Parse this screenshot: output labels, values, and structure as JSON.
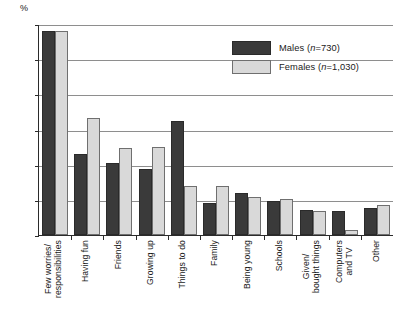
{
  "chart_data": {
    "type": "bar",
    "title": "",
    "xlabel": "",
    "ylabel": "%",
    "ylim": [
      0,
      30
    ],
    "yticks": [
      0,
      5,
      10,
      15,
      20,
      25,
      30
    ],
    "grid": true,
    "legend_position": "top-right",
    "categories": [
      "Few worries/\nresponsibilities",
      "Having fun",
      "Friends",
      "Growing up",
      "Things to do",
      "Family",
      "Being young",
      "Schools",
      "Given/\nbought things",
      "Computers\nand TV",
      "Other"
    ],
    "series": [
      {
        "name": "Males (n=730)",
        "key": "males",
        "color": "#3a3a3a",
        "values": [
          29.0,
          11.5,
          10.2,
          9.4,
          16.2,
          4.6,
          6.0,
          4.9,
          3.5,
          3.4,
          3.9
        ]
      },
      {
        "name": "Females (n=1,030)",
        "key": "females",
        "color": "#d9d9d9",
        "values": [
          29.0,
          16.6,
          12.4,
          12.5,
          7.0,
          7.0,
          5.4,
          5.1,
          3.4,
          0.7,
          4.2
        ]
      }
    ]
  },
  "axis": {
    "y_label": "%",
    "ticks": [
      "30",
      "25",
      "20",
      "15",
      "10",
      "5",
      "0"
    ]
  },
  "legend": {
    "items": [
      {
        "label_prefix": "Males (",
        "label_italic": "n",
        "label_suffix": "=730)",
        "swatch": "males"
      },
      {
        "label_prefix": "Females (",
        "label_italic": "n",
        "label_suffix": "=1,030)",
        "swatch": "females"
      }
    ]
  }
}
